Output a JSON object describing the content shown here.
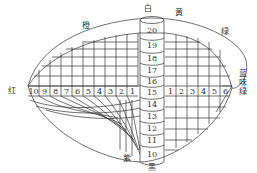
{
  "diagram": {
    "hue_labels": {
      "orange": "橙",
      "white": "白",
      "yellow": "黄",
      "green": "绿",
      "bluish_green": "蓝味绿",
      "red": "红",
      "purple": "紫",
      "black": "黑"
    },
    "left_chroma_cells": [
      "10",
      "9",
      "8",
      "7",
      "6",
      "5",
      "4",
      "3",
      "2",
      "1"
    ],
    "right_chroma_cells": [
      "1",
      "2",
      "3",
      "4",
      "5",
      "6"
    ],
    "value_axis_upper": [
      "20",
      "19",
      "18",
      "17",
      "16"
    ],
    "value_axis_center": "15",
    "value_axis_lower": [
      "14",
      "13",
      "12",
      "11",
      "10"
    ],
    "colors": {
      "line": "#333333",
      "background": "#ffffff"
    }
  }
}
